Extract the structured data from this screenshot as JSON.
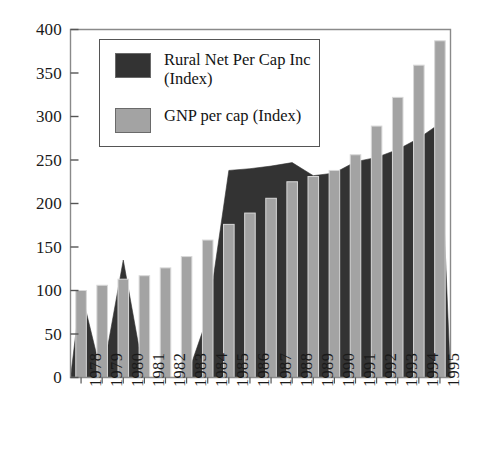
{
  "chart_data": {
    "type": "bar",
    "title": "",
    "subtitle": "",
    "xlabel": "",
    "ylabel": "",
    "categories": [
      "1978",
      "1979",
      "1980",
      "1981",
      "1982",
      "1983",
      "1984",
      "1985",
      "1986",
      "1987",
      "1988",
      "1989",
      "1990",
      "1991",
      "1992",
      "1993",
      "1994",
      "1995"
    ],
    "xtick_labels": [
      "1978",
      "1979",
      "1980",
      "1981",
      "1982",
      "1983",
      "1984",
      "1985",
      "1986",
      "1987",
      "1988",
      "1989",
      "1990",
      "1991",
      "1992",
      "1993",
      "1994",
      "1995"
    ],
    "ytick_labels": [
      "0",
      "50",
      "100",
      "150",
      "200",
      "250",
      "300",
      "350",
      "400"
    ],
    "ytick_values": [
      0,
      50,
      100,
      150,
      200,
      250,
      300,
      350,
      400
    ],
    "ylim": [
      0,
      400
    ],
    "grid": false,
    "legend_position": "upper-left-inside",
    "series": [
      {
        "name": "Rural Net Per Cap Inc (Index)",
        "legend_label": "Rural Net Per Cap Inc\n(Index)",
        "render": "area",
        "color": "#333333",
        "values": [
          100,
          0,
          135,
          0,
          0,
          0,
          70,
          238,
          240,
          243,
          247,
          232,
          235,
          248,
          253,
          262,
          275,
          292
        ]
      },
      {
        "name": "GNP per cap (Index)",
        "legend_label": "GNP per cap (Index)",
        "render": "bar",
        "color": "#a3a3a3",
        "values": [
          100,
          106,
          113,
          117,
          126,
          139,
          158,
          176,
          189,
          206,
          225,
          231,
          238,
          256,
          289,
          322,
          359,
          387
        ]
      }
    ],
    "annotations": []
  },
  "legend": {
    "entries": [
      {
        "label": "Rural Net Per Cap Inc\n(Index)",
        "color": "#333333"
      },
      {
        "label": "GNP per cap (Index)",
        "color": "#a3a3a3"
      }
    ]
  },
  "axes": {
    "frame_color": "#8a8a8a",
    "tick_color": "#555555",
    "text_color": "#1a1a1a"
  }
}
